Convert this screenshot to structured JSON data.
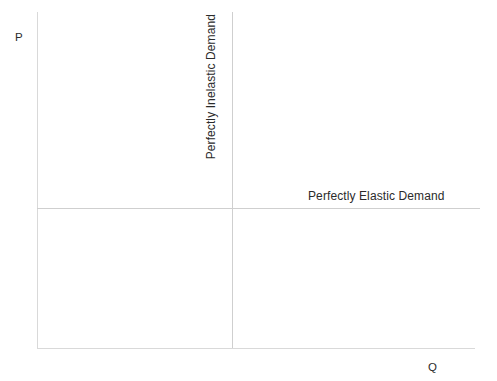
{
  "figure": {
    "type": "economics-demand-curve-diagram",
    "background_color": "#ffffff",
    "axis_color": "#d9d9d9",
    "curve_color": "#cfcfcf",
    "text_color": "#2b2b2b"
  },
  "axes": {
    "y_label": "P",
    "x_label": "Q"
  },
  "curves": [
    {
      "name": "perfectly-inelastic-demand",
      "label": "Perfectly Inelastic Demand",
      "orientation": "vertical"
    },
    {
      "name": "perfectly-elastic-demand",
      "label": "Perfectly Elastic Demand",
      "orientation": "horizontal"
    }
  ],
  "chart_data": {
    "type": "line",
    "title": "",
    "subtitle": "",
    "xlabel": "Q",
    "ylabel": "P",
    "grid": false,
    "legend_position": "inline-annotations",
    "xlim": [
      0,
      100
    ],
    "ylim": [
      0,
      100
    ],
    "xticks": [],
    "yticks": [],
    "series": [
      {
        "name": "Perfectly Inelastic Demand",
        "kind": "vertical-line",
        "x": [
          44.5,
          44.5
        ],
        "y": [
          0,
          100
        ],
        "annotation": "Perfectly Inelastic Demand",
        "annotation_rotation": -90,
        "color": "#cfcfcf"
      },
      {
        "name": "Perfectly Elastic Demand",
        "kind": "horizontal-line",
        "x": [
          0,
          100
        ],
        "y": [
          41.7,
          41.7
        ],
        "annotation": "Perfectly Elastic Demand",
        "annotation_rotation": 0,
        "color": "#cfcfcf"
      }
    ],
    "annotations": [
      {
        "text": "Perfectly Inelastic Demand",
        "rotation": -90
      },
      {
        "text": "Perfectly Elastic Demand",
        "rotation": 0
      },
      {
        "text": "P",
        "rotation": 0
      },
      {
        "text": "Q",
        "rotation": 0
      }
    ]
  }
}
